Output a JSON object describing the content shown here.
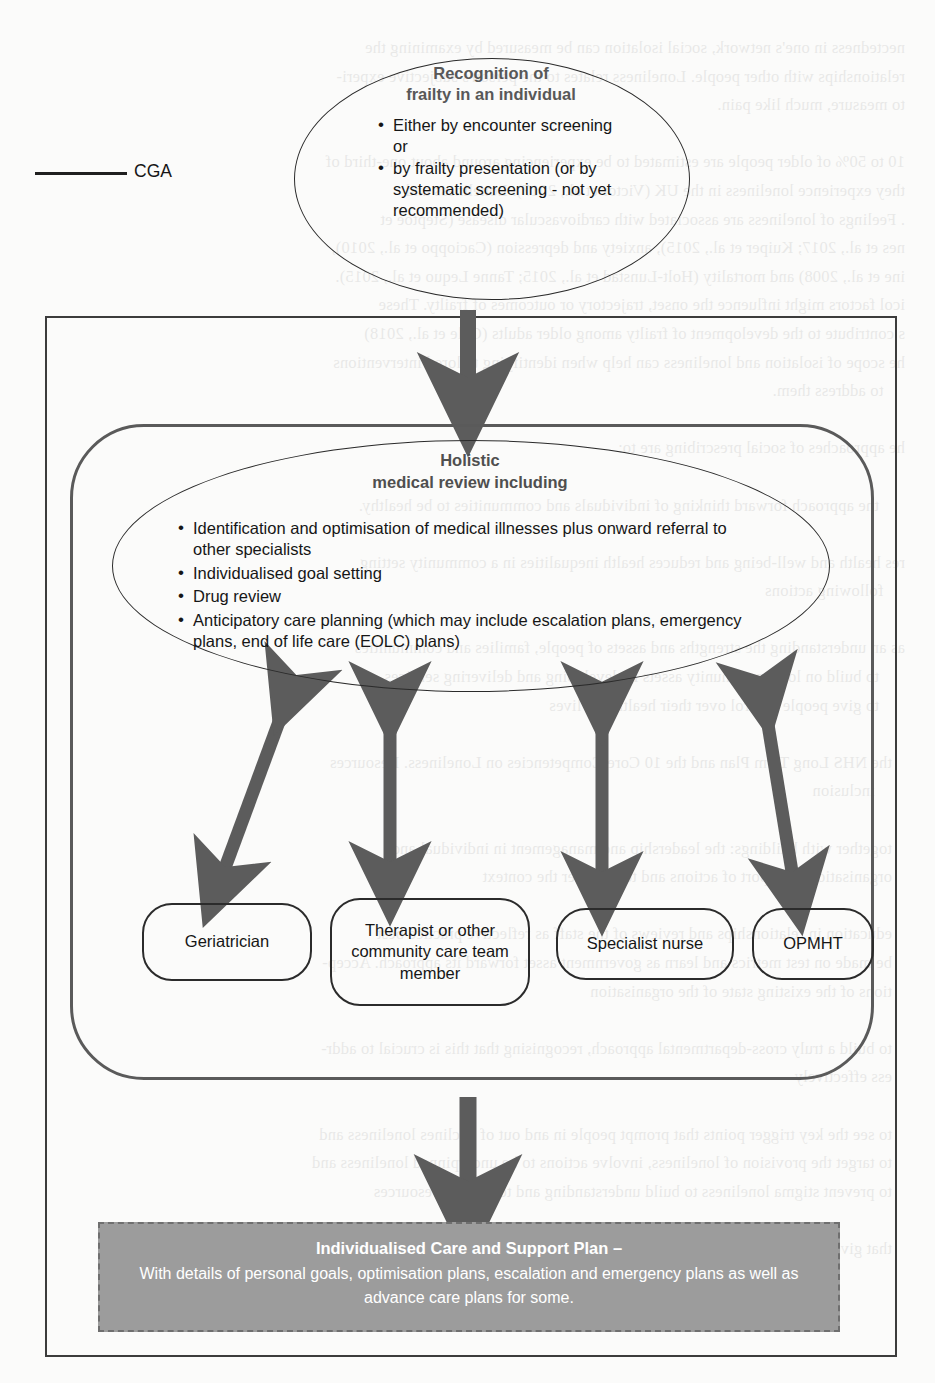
{
  "legend": {
    "cga_label": "CGA",
    "line_color": "#1f1f1f"
  },
  "top_ellipse": {
    "title_line1": "Recognition of",
    "title_line2": "frailty in an individual",
    "bullets": [
      "Either by encounter screening or",
      "by frailty presentation (or by systematic screening - not yet recommended)"
    ]
  },
  "holistic_ellipse": {
    "title_line1": "Holistic",
    "title_line2": "medical review including",
    "bullets": [
      "Identification and optimisation of medical illnesses plus onward referral to other specialists",
      "Individualised goal setting",
      "Drug review",
      "Anticipatory care planning (which may include escalation plans, emergency plans, end of life care (EOLC) plans)"
    ]
  },
  "roles": [
    {
      "name": "geriatrician",
      "label": "Geriatrician"
    },
    {
      "name": "therapist",
      "label": "Therapist or other community care team member"
    },
    {
      "name": "specialist-nurse",
      "label": "Specialist nurse"
    },
    {
      "name": "opmht",
      "label": "OPMHT"
    }
  ],
  "plan_box": {
    "title": "Individualised Care and Support Plan –",
    "subtitle": "With details of personal goals, optimisation plans, escalation and emergency plans as well as advance care plans for some.",
    "fill_color": "#9c9c9c",
    "border_color": "#6f6f6f",
    "text_color": "#ffffff"
  },
  "colors": {
    "arrow": "#5c5c5c",
    "outline_dark": "#2b2b2b",
    "container_outline": "#5a5a5a",
    "heading_grey": "#585858"
  },
  "background_ghost_text": "nectedness in one's network, social isolation can be measured by examining the\nrelationships with other people. Loneliness relates to the person's subjective experi-\nto measure, much like pain.\n\n10 to 50% of older people are estimated to be experiencing around about one-third of\nthey experience loneliness in the UK (Victor et al., 2017). Loneliness and\n. Feelings of loneliness are associated with cardiovascular disease (Steptoe et\nnes et al., 2017; Kuiper et al., 2015), anxiety and depression (Cacioppo et al., 2010),\nine et al., 2008) and mortality (Holt-Lunstad et al., 2015; Tanne Lequo et al., 2015).\nicol factors might influence the onset, trajectory or outcomes of frailty. These\ns contribute to the development of frailty among older adults (Gale et al., 2018)\nhe scope of isolation and loneliness can help when identifying tailored interventions\n     to address them.\n\nhe approaches of social prescribing are to:\n\n      the approach forward thinking of individuals and communities to be healthy.\n\nres health and well-being and reduces health inequalities in a community setting\n     following actions\n\nas an understanding the strengths and assets of people, families and communities\n      to build on local community assets in developing and delivering services\n      to give people control over their health and lives\n\n   the NHS Long Term Plan and the 10 Core Competencies on Loneliness. Resources\n       inclusion\n\n   together with buildings: the leadership and management in individual and\n   organisational support of actions and to consider the context\n\n   education in relationships and reviews of the staff as reflective practice best\n   be made on test metrics and learn as government asset forward its approach. Accep-\n   tions of the existing state of the organisation\n\n   to build a truly cross-departmental approach, recognising that this is crucial to addr-\n   ess effectively\n\n   to see the key trigger points that prompt people in and out of declines loneliness and\n   to target the provision of loneliness, involve actions to be underpinned loneliness and\n   to prevent stigma loneliness to build understanding and to provide resources\n\n   that given the complex and subjective nature of loneliness"
}
